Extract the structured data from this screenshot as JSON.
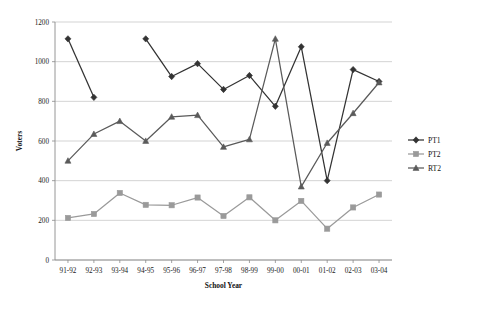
{
  "chart_data": {
    "type": "line",
    "title": "",
    "xlabel": "School Year",
    "ylabel": "Voters",
    "categories": [
      "91-92",
      "92-93",
      "93-94",
      "94-95",
      "95-96",
      "96-97",
      "97-98",
      "98-99",
      "99-00",
      "00-01",
      "01-02",
      "02-03",
      "03-04"
    ],
    "ylim": [
      0,
      1200
    ],
    "yticks": [
      0,
      200,
      400,
      600,
      800,
      1000,
      1200
    ],
    "grid": true,
    "legend_position": "right",
    "series": [
      {
        "name": "PT1",
        "marker": "diamond",
        "color": "#333333",
        "values": [
          1115,
          820,
          null,
          1115,
          925,
          990,
          860,
          930,
          775,
          1075,
          400,
          960,
          900
        ]
      },
      {
        "name": "PT2",
        "marker": "square",
        "color": "#9a9a9a",
        "values": [
          212,
          232,
          338,
          278,
          276,
          315,
          222,
          316,
          200,
          298,
          158,
          265,
          330
        ]
      },
      {
        "name": "RT2",
        "marker": "triangle",
        "color": "#5a5a5a",
        "values": [
          500,
          635,
          700,
          600,
          722,
          730,
          570,
          608,
          1115,
          370,
          590,
          740,
          895
        ]
      }
    ]
  },
  "legend": {
    "items": [
      {
        "label": "PT1"
      },
      {
        "label": "PT2"
      },
      {
        "label": "RT2"
      }
    ]
  },
  "axes": {
    "y_title": "Voters",
    "x_title": "School Year",
    "y_tick_labels": [
      "1200",
      "1000",
      "800",
      "600",
      "400",
      "200",
      "0"
    ]
  }
}
